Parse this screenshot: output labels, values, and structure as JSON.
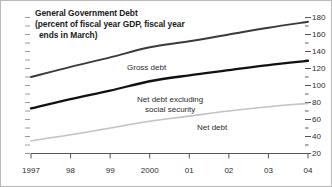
{
  "figure": {
    "border_color": "#b9b9b9",
    "background": "#ffffff"
  },
  "title": {
    "line1": "General Government Debt",
    "line2": "(percent of fiscal year GDP, fiscal year",
    "line3": "ends in March)"
  },
  "labels": {
    "gross_debt": "Gross debt",
    "net_debt_ex_ss_line1": "Net debt excluding",
    "net_debt_ex_ss_line2": "social security",
    "net_debt": "Net debt"
  },
  "chart_data": {
    "type": "line",
    "title": "General Government Debt (percent of fiscal year GDP, fiscal year ends in March)",
    "xlabel": "",
    "ylabel": "",
    "x": [
      1997,
      1998,
      1999,
      2000,
      2001,
      2002,
      2003,
      2004
    ],
    "categories": [
      "1997",
      "98",
      "99",
      "2000",
      "01",
      "02",
      "03",
      "04"
    ],
    "x_tick_labels": [
      "1997",
      "98",
      "99",
      "2000",
      "01",
      "02",
      "03",
      "04"
    ],
    "y_tick_labels": [
      "180",
      "160",
      "140",
      "120",
      "100",
      "80",
      "60",
      "40",
      "20"
    ],
    "y_ticks": [
      180,
      160,
      140,
      120,
      100,
      80,
      60,
      40,
      20
    ],
    "ylim": [
      20,
      180
    ],
    "y_minor_step": 10,
    "y_axis_position": "right",
    "grid": false,
    "legend": "inline-annotations",
    "series": [
      {
        "name": "Gross debt",
        "color": "#3a3a3a",
        "width": 1.9,
        "values": [
          110,
          122,
          133,
          145,
          152,
          160,
          168,
          175
        ]
      },
      {
        "name": "Net debt excluding social security",
        "color": "#111111",
        "width": 2.3,
        "values": [
          73,
          84,
          94,
          105,
          112,
          118,
          124,
          129
        ]
      },
      {
        "name": "Net debt",
        "color": "#c2c2c2",
        "width": 1.6,
        "values": [
          35,
          42,
          50,
          58,
          64,
          70,
          75,
          79
        ]
      }
    ]
  }
}
